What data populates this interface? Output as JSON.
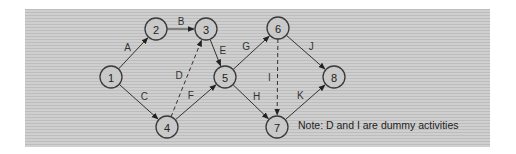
{
  "diagram": {
    "type": "activity-on-arrow network",
    "nodes": [
      {
        "id": "1",
        "label": "1",
        "x": 111,
        "y": 77
      },
      {
        "id": "2",
        "label": "2",
        "x": 156,
        "y": 29
      },
      {
        "id": "3",
        "label": "3",
        "x": 206,
        "y": 29
      },
      {
        "id": "4",
        "label": "4",
        "x": 167,
        "y": 127
      },
      {
        "id": "5",
        "label": "5",
        "x": 225,
        "y": 77
      },
      {
        "id": "6",
        "label": "6",
        "x": 278,
        "y": 28
      },
      {
        "id": "7",
        "label": "7",
        "x": 277,
        "y": 127
      },
      {
        "id": "8",
        "label": "8",
        "x": 334,
        "y": 77
      }
    ],
    "edges": [
      {
        "label": "A",
        "from": "1",
        "to": "2",
        "dummy": false
      },
      {
        "label": "B",
        "from": "2",
        "to": "3",
        "dummy": false
      },
      {
        "label": "C",
        "from": "1",
        "to": "4",
        "dummy": false
      },
      {
        "label": "D",
        "from": "4",
        "to": "3",
        "dummy": true
      },
      {
        "label": "E",
        "from": "3",
        "to": "5",
        "dummy": false
      },
      {
        "label": "F",
        "from": "4",
        "to": "5",
        "dummy": false
      },
      {
        "label": "G",
        "from": "5",
        "to": "6",
        "dummy": false
      },
      {
        "label": "H",
        "from": "5",
        "to": "7",
        "dummy": false
      },
      {
        "label": "I",
        "from": "6",
        "to": "7",
        "dummy": true
      },
      {
        "label": "J",
        "from": "6",
        "to": "8",
        "dummy": false
      },
      {
        "label": "K",
        "from": "7",
        "to": "8",
        "dummy": false
      }
    ],
    "note": "Note: D and I are dummy activities"
  }
}
